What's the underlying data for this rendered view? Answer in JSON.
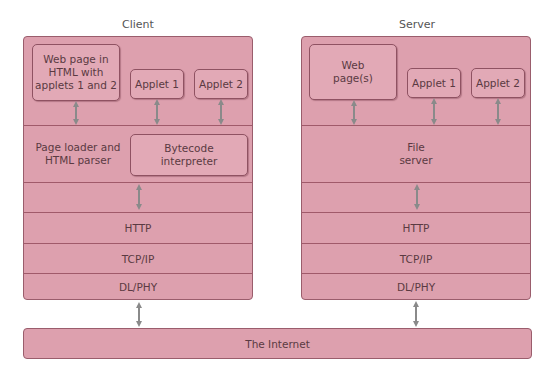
{
  "client": {
    "title": "Client",
    "boxes": {
      "web_page": "Web page in\nHTML with\napplets 1 and 2",
      "applet1": "Applet 1",
      "applet2": "Applet 2",
      "page_loader": "Page loader and\nHTML parser",
      "bytecode": "Bytecode\ninterpreter"
    },
    "layers": [
      "HTTP",
      "TCP/IP",
      "DL/PHY"
    ]
  },
  "server": {
    "title": "Server",
    "boxes": {
      "web_page": "Web\npage(s)",
      "applet1": "Applet 1",
      "applet2": "Applet 2",
      "file_server": "File\nserver"
    },
    "layers": [
      "HTTP",
      "TCP/IP",
      "DL/PHY"
    ]
  },
  "network": {
    "label": "The Internet"
  },
  "colors": {
    "box_fill": "#dda0ae",
    "box_border": "#9a5d6c",
    "arrow": "#8a8a8a"
  }
}
